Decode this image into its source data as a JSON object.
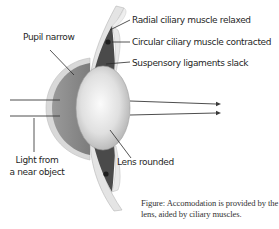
{
  "figure": {
    "title_labels": {
      "radial": "Radial ciliary muscle relaxed",
      "circular": "Circular ciliary muscle contracted",
      "suspensory": "Suspensory ligaments slack",
      "pupil": "Pupil narrow",
      "light_line1": "Light from",
      "light_line2": "a near object",
      "lens": "Lens rounded"
    },
    "caption_line1": "Figure: Accomodation is provided by the",
    "caption_line2": "lens, aided by ciliary muscles.",
    "colors": {
      "iris": "#8a8a8a",
      "cornea_rim": "#d4d4d4",
      "muscle": "#4a4a4a",
      "lens_light": "#f4f4f4",
      "lens_dark": "#b8b8b8",
      "sclera": "#e6e6e6",
      "ray": "#3a3a3a",
      "text": "#1f1f1f"
    }
  }
}
